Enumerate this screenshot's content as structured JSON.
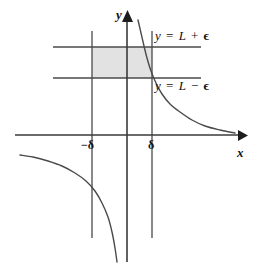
{
  "figure": {
    "background_color": "#ffffff",
    "line_color": "#4a4a4a",
    "axis_color": "#3a3a3a",
    "band_fill_color": "#e2e2e2",
    "text_color": "#111111",
    "width": 264,
    "height": 271
  },
  "axes": {
    "x_label": "x",
    "y_label": "y",
    "x_axis_y": 135,
    "y_axis_x": 127,
    "x_arrow_tip": 245,
    "y_arrow_tip": 12
  },
  "labels": {
    "upper_band": {
      "lhs": "y",
      "equals": "=",
      "limit": "L",
      "operator": "+",
      "epsilon": "ϵ",
      "full": "y = L + ϵ"
    },
    "lower_band": {
      "lhs": "y",
      "equals": "=",
      "limit": "L",
      "operator": "−",
      "epsilon": "ϵ",
      "full": "y = L − ϵ"
    },
    "tick_neg_delta": "−δ",
    "tick_pos_delta": "δ"
  },
  "chart_data": {
    "type": "line",
    "title": "",
    "xlabel": "x",
    "ylabel": "y",
    "grid": false,
    "legend": null,
    "annotations": [
      {
        "text": "y = L + ϵ",
        "x_px": 155,
        "y_px": 29
      },
      {
        "text": "y = L − ϵ",
        "x_px": 155,
        "y_px": 79
      },
      {
        "text": "−δ",
        "x_px": 81,
        "y_px": 139
      },
      {
        "text": "δ",
        "x_px": 148,
        "y_px": 139
      }
    ],
    "guide_lines": [
      {
        "name": "y = L + epsilon",
        "orientation": "horizontal",
        "y_px": 47,
        "x_from_px": 53,
        "x_to_px": 201
      },
      {
        "name": "y = L - epsilon",
        "orientation": "horizontal",
        "y_px": 78,
        "x_from_px": 53,
        "x_to_px": 201
      },
      {
        "name": "x = -delta",
        "orientation": "vertical",
        "x_px": 92,
        "y_from_px": 31,
        "y_to_px": 238
      },
      {
        "name": "x = delta",
        "orientation": "vertical",
        "x_px": 152,
        "y_from_px": 31,
        "y_to_px": 238
      }
    ],
    "shaded_band": {
      "x_from_px": 92,
      "x_to_px": 152,
      "y_top_px": 47,
      "y_bottom_px": 78
    },
    "series": [
      {
        "name": "branch-upper-right",
        "points_px": [
          [
            138,
            20
          ],
          [
            141,
            33
          ],
          [
            144,
            46
          ],
          [
            147,
            58
          ],
          [
            151,
            71
          ],
          [
            156,
            83
          ],
          [
            162,
            94
          ],
          [
            170,
            104
          ],
          [
            180,
            112
          ],
          [
            192,
            120
          ],
          [
            205,
            126
          ],
          [
            220,
            130
          ],
          [
            235,
            133
          ]
        ]
      },
      {
        "name": "branch-lower-left",
        "points_px": [
          [
            20,
            155
          ],
          [
            33,
            157
          ],
          [
            48,
            161
          ],
          [
            62,
            166
          ],
          [
            75,
            173
          ],
          [
            86,
            181
          ],
          [
            95,
            191
          ],
          [
            102,
            203
          ],
          [
            108,
            217
          ],
          [
            112,
            232
          ],
          [
            115,
            248
          ],
          [
            117,
            262
          ]
        ]
      }
    ]
  }
}
